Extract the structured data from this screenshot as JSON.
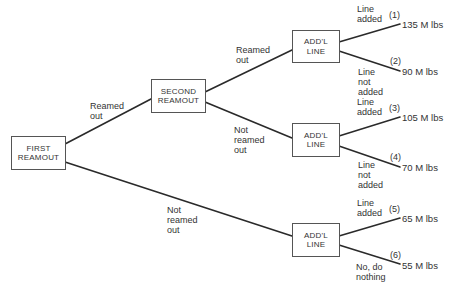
{
  "nodes": {
    "first_reamout": {
      "line1": "FIRST",
      "line2": "REAMOUT"
    },
    "second_reamout": {
      "line1": "SECOND",
      "line2": "REAMOUT"
    },
    "addl_line_top": {
      "line1": "ADD'L",
      "line2": "LINE"
    },
    "addl_line_mid": {
      "line1": "ADD'L",
      "line2": "LINE"
    },
    "addl_line_bottom": {
      "line1": "ADD'L",
      "line2": "LINE"
    }
  },
  "branches": {
    "first_to_second": {
      "line1": "Reamed",
      "line2": "out"
    },
    "first_to_bottom": {
      "line1": "Not",
      "line2": "reamed",
      "line3": "out"
    },
    "second_to_top": {
      "line1": "Reamed",
      "line2": "out"
    },
    "second_to_mid": {
      "line1": "Not",
      "line2": "reamed",
      "line3": "out"
    },
    "top_added": {
      "line1": "Line",
      "line2": "added"
    },
    "top_not_added": {
      "line1": "Line",
      "line2": "not",
      "line3": "added"
    },
    "mid_added": {
      "line1": "Line",
      "line2": "added"
    },
    "mid_not_added": {
      "line1": "Line",
      "line2": "not",
      "line3": "added"
    },
    "bottom_added": {
      "line1": "Line",
      "line2": "added"
    },
    "bottom_nothing": {
      "line1": "No, do",
      "line2": "nothing"
    }
  },
  "outcomes": [
    {
      "number": "(1)",
      "value": "135 M lbs"
    },
    {
      "number": "(2)",
      "value": "90 M lbs"
    },
    {
      "number": "(3)",
      "value": "105 M lbs"
    },
    {
      "number": "(4)",
      "value": "70 M lbs"
    },
    {
      "number": "(5)",
      "value": "65 M lbs"
    },
    {
      "number": "(6)",
      "value": "55 M lbs"
    }
  ]
}
